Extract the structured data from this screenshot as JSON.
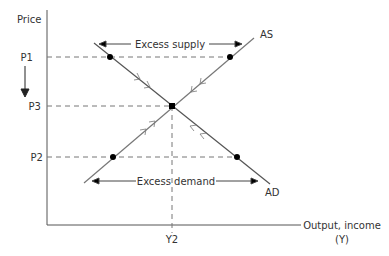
{
  "diagram": {
    "y_axis_label": "Price",
    "x_axis_label_line1": "Output, income",
    "x_axis_label_line2": "(Y)",
    "price_levels": {
      "p1": "P1",
      "p3": "P3",
      "p2": "P2"
    },
    "output_level": "Y2",
    "curves": {
      "as": "AS",
      "ad": "AD"
    },
    "annotations": {
      "excess_supply": "Excess supply",
      "excess_demand": "Excess demand"
    },
    "colors": {
      "line": "#555555",
      "dashed": "#777777",
      "text": "#333333",
      "point": "#000000"
    }
  }
}
